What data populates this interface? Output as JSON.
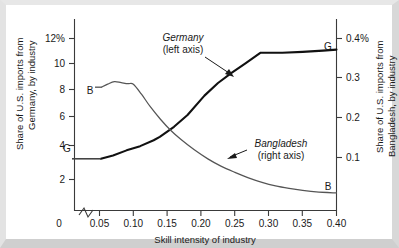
{
  "chart_data": {
    "type": "line",
    "title": "",
    "xlabel": "Skill intensity of industry",
    "xlim": [
      0.05,
      0.4
    ],
    "x_ticks": [
      "0",
      "0.05",
      "0.10",
      "0.15",
      "0.20",
      "0.25",
      "0.30",
      "0.35",
      "0.40"
    ],
    "x_tick_values": [
      0,
      0.05,
      0.1,
      0.15,
      0.2,
      0.25,
      0.3,
      0.35,
      0.4
    ],
    "axis_break": true,
    "grid": false,
    "legend_position": "inline-annotations",
    "left_axis": {
      "label": "Share of U.S. imports from Germany, by industry",
      "ticks": [
        "12%",
        "10",
        "8",
        "6",
        "4",
        "2"
      ],
      "tick_values": [
        12,
        10,
        8,
        6,
        4,
        2
      ],
      "ylim": [
        1.2,
        12.6
      ],
      "unit": "%"
    },
    "right_axis": {
      "label": "Share of U.S. imports from Bangladesh, by industry",
      "ticks": [
        "0.4%",
        "0.3",
        "0.2",
        "0.1"
      ],
      "tick_values": [
        0.4,
        0.3,
        0.2,
        0.1
      ],
      "ylim": [
        0.035,
        0.418
      ],
      "unit": "%"
    },
    "series": [
      {
        "name": "Germany",
        "axis": "left",
        "annotation": "Germany",
        "annotation_sub": "(left axis)",
        "start_tag": "G",
        "end_tag": "G",
        "x": [
          0.052,
          0.07,
          0.09,
          0.11,
          0.13,
          0.139,
          0.16,
          0.18,
          0.205,
          0.225,
          0.245,
          0.265,
          0.288,
          0.3,
          0.32,
          0.35,
          0.38,
          0.4
        ],
        "values": [
          4.3,
          4.5,
          4.8,
          5.05,
          5.4,
          5.6,
          6.2,
          6.9,
          8.05,
          8.8,
          9.4,
          9.95,
          10.6,
          10.6,
          10.6,
          10.65,
          10.72,
          10.78
        ]
      },
      {
        "name": "Bangladesh",
        "axis": "right",
        "annotation": "Bangladesh",
        "annotation_sub": "(right axis)",
        "start_tag": "B",
        "end_tag": "B",
        "x": [
          0.053,
          0.062,
          0.072,
          0.082,
          0.092,
          0.1,
          0.112,
          0.125,
          0.14,
          0.155,
          0.17,
          0.19,
          0.21,
          0.23,
          0.25,
          0.27,
          0.29,
          0.31,
          0.33,
          0.35,
          0.37,
          0.4
        ],
        "values": [
          0.282,
          0.288,
          0.293,
          0.291,
          0.289,
          0.288,
          0.268,
          0.243,
          0.218,
          0.196,
          0.178,
          0.157,
          0.139,
          0.124,
          0.112,
          0.101,
          0.092,
          0.085,
          0.08,
          0.076,
          0.073,
          0.071
        ]
      }
    ]
  }
}
